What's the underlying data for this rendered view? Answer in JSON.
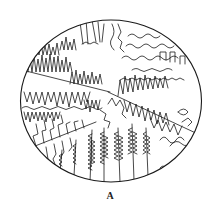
{
  "figure": {
    "label": "A",
    "stroke_color": "#1a1a1a",
    "background": "#ffffff",
    "frame_shape": "ellipse"
  },
  "top_fragment": {
    "text": ""
  }
}
